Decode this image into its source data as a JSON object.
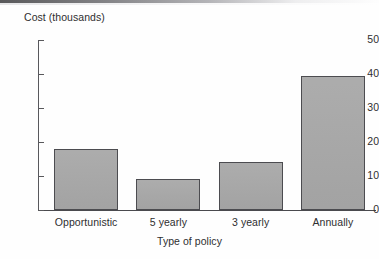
{
  "figure": {
    "background_color": "#fefefe",
    "bar_fill_color": "#a8a8a8",
    "bar_edge_color": "#4c4c50",
    "axis_color": "#58585c",
    "text_color": "#2e2e30"
  },
  "chart_data": {
    "type": "bar",
    "title": "",
    "xlabel": "Type of policy",
    "ylabel": "Cost (thousands)",
    "categories": [
      "Opportunistic",
      "5 yearly",
      "3 yearly",
      "Annually"
    ],
    "values": [
      18,
      9,
      14,
      39.5
    ],
    "ylim": [
      0,
      50
    ],
    "yticks": [
      0,
      10,
      20,
      30,
      40,
      50
    ],
    "ytick_labels": [
      "0",
      "10",
      "20",
      "30",
      "40",
      "50"
    ],
    "grid": false,
    "legend": null,
    "orientation": "vertical"
  }
}
